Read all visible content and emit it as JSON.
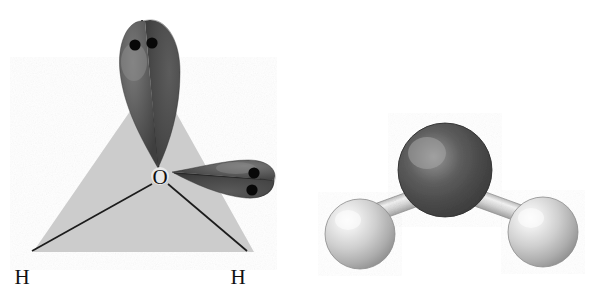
{
  "figure": {
    "background_color": "#ffffff",
    "panels": [
      {
        "id": "orbital-diagram",
        "name": "tetrahedral-orbital-diagram",
        "description": "Tetrahedral lone-pair / bonding diagram of water",
        "shape": {
          "type": "triangle",
          "fill_color": "#cfcfcf",
          "apex": [
            155,
            75
          ],
          "base_left": [
            33,
            252
          ],
          "base_right": [
            254,
            252
          ]
        },
        "center_atom": {
          "label": "O",
          "name": "oxygen-center-label",
          "x": 160,
          "y": 176,
          "element": "oxygen"
        },
        "bonded_atoms": [
          {
            "label": "H",
            "name": "hydrogen-left-label",
            "x": 22,
            "y": 280,
            "element": "hydrogen"
          },
          {
            "label": "H",
            "name": "hydrogen-right-label",
            "x": 238,
            "y": 280,
            "element": "hydrogen"
          }
        ],
        "bonds": [
          {
            "name": "bond-o-h-left",
            "from": [
              152,
              184
            ],
            "to": [
              32,
              251
            ]
          },
          {
            "name": "bond-o-h-right",
            "from": [
              168,
              184
            ],
            "to": [
              246,
              251
            ]
          }
        ],
        "lone_pairs": [
          {
            "name": "lone-pair-lobe-top",
            "orientation": "up",
            "lobe_color": "#555555",
            "electron_dots": 2,
            "dot_color": "#000000",
            "dots": [
              [
                134,
                45
              ],
              [
                151,
                43
              ]
            ],
            "axis_line": {
              "from": [
                158,
                172
              ],
              "to": [
                143,
                22
              ]
            }
          },
          {
            "name": "lone-pair-lobe-right",
            "orientation": "right",
            "lobe_color": "#555555",
            "electron_dots": 2,
            "dot_color": "#000000",
            "dots": [
              [
                253,
                173
              ],
              [
                251,
                190
              ]
            ],
            "axis_line": {
              "from": [
                170,
                176
              ],
              "to": [
                266,
                192
              ]
            }
          }
        ]
      },
      {
        "id": "space-filling-model",
        "name": "space-filling-model",
        "description": "Ball-and-stick / space-filling model of water",
        "atoms": [
          {
            "name": "oxygen-sphere",
            "element": "O",
            "color": "#4a4a4a",
            "highlight_color": "#9c9c9c",
            "cx": 445,
            "cy": 170,
            "r": 47
          },
          {
            "name": "hydrogen-sphere-left",
            "element": "H",
            "color": "#d8d8d8",
            "highlight_color": "#ffffff",
            "cx": 360,
            "cy": 234,
            "r": 35
          },
          {
            "name": "hydrogen-sphere-right",
            "element": "H",
            "color": "#d8d8d8",
            "highlight_color": "#ffffff",
            "cx": 543,
            "cy": 232,
            "r": 35
          }
        ],
        "bonds": [
          {
            "name": "bond-cylinder-left",
            "color": "#c8c8c8",
            "from": [
              372,
              222
            ],
            "to": [
              421,
              203
            ],
            "width": 16
          },
          {
            "name": "bond-cylinder-right",
            "color": "#c8c8c8",
            "from": [
              470,
              203
            ],
            "to": [
              528,
              221
            ],
            "width": 16
          }
        ]
      }
    ]
  }
}
